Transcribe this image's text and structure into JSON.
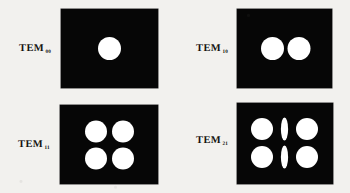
{
  "figure": {
    "background_color": "#f2f1ee",
    "panel_color": "#060606",
    "lobe_color": "#ffffff",
    "caption": ""
  },
  "modes": [
    {
      "id": "tem00",
      "label_text": "TEM",
      "subscript": "00",
      "panel": {
        "x": 61,
        "y": 9,
        "w": 97,
        "h": 79
      },
      "pattern": {
        "columns": 1,
        "rows": 1
      },
      "lobes": [
        {
          "cx": 48.5,
          "cy": 39.5,
          "rx": 11.5,
          "ry": 11.5
        }
      ],
      "label_pos": {
        "x": 19,
        "y": 44
      }
    },
    {
      "id": "tem10",
      "label_text": "TEM",
      "subscript": "10",
      "panel": {
        "x": 237,
        "y": 9,
        "w": 95,
        "h": 79
      },
      "pattern": {
        "columns": 2,
        "rows": 1
      },
      "lobes": [
        {
          "cx": 35.5,
          "cy": 39.5,
          "rx": 11.5,
          "ry": 11.5
        },
        {
          "cx": 62.0,
          "cy": 39.5,
          "rx": 11.5,
          "ry": 11.5
        }
      ],
      "label_pos": {
        "x": 196,
        "y": 44
      }
    },
    {
      "id": "tem11",
      "label_text": "TEM",
      "subscript": "11",
      "panel": {
        "x": 60,
        "y": 105,
        "w": 98,
        "h": 79
      },
      "pattern": {
        "columns": 2,
        "rows": 2
      },
      "lobes": [
        {
          "cx": 36.0,
          "cy": 26.5,
          "rx": 11.0,
          "ry": 11.0
        },
        {
          "cx": 63.0,
          "cy": 26.5,
          "rx": 11.0,
          "ry": 11.0
        },
        {
          "cx": 36.0,
          "cy": 53.5,
          "rx": 11.0,
          "ry": 11.0
        },
        {
          "cx": 63.0,
          "cy": 53.5,
          "rx": 11.0,
          "ry": 11.0
        }
      ],
      "label_pos": {
        "x": 18,
        "y": 140
      }
    },
    {
      "id": "tem21",
      "label_text": "TEM",
      "subscript": "21",
      "panel": {
        "x": 237,
        "y": 103,
        "w": 96,
        "h": 81
      },
      "pattern": {
        "columns": 3,
        "rows": 2
      },
      "lobes": [
        {
          "cx": 25.0,
          "cy": 26.0,
          "rx": 11.0,
          "ry": 11.0
        },
        {
          "cx": 47.5,
          "cy": 26.0,
          "rx": 3.6,
          "ry": 11.5
        },
        {
          "cx": 70.0,
          "cy": 26.0,
          "rx": 11.0,
          "ry": 11.0
        },
        {
          "cx": 25.0,
          "cy": 54.0,
          "rx": 11.0,
          "ry": 11.0
        },
        {
          "cx": 47.5,
          "cy": 54.0,
          "rx": 3.6,
          "ry": 11.5
        },
        {
          "cx": 70.0,
          "cy": 54.0,
          "rx": 11.0,
          "ry": 11.0
        }
      ],
      "label_pos": {
        "x": 196,
        "y": 136
      }
    }
  ]
}
